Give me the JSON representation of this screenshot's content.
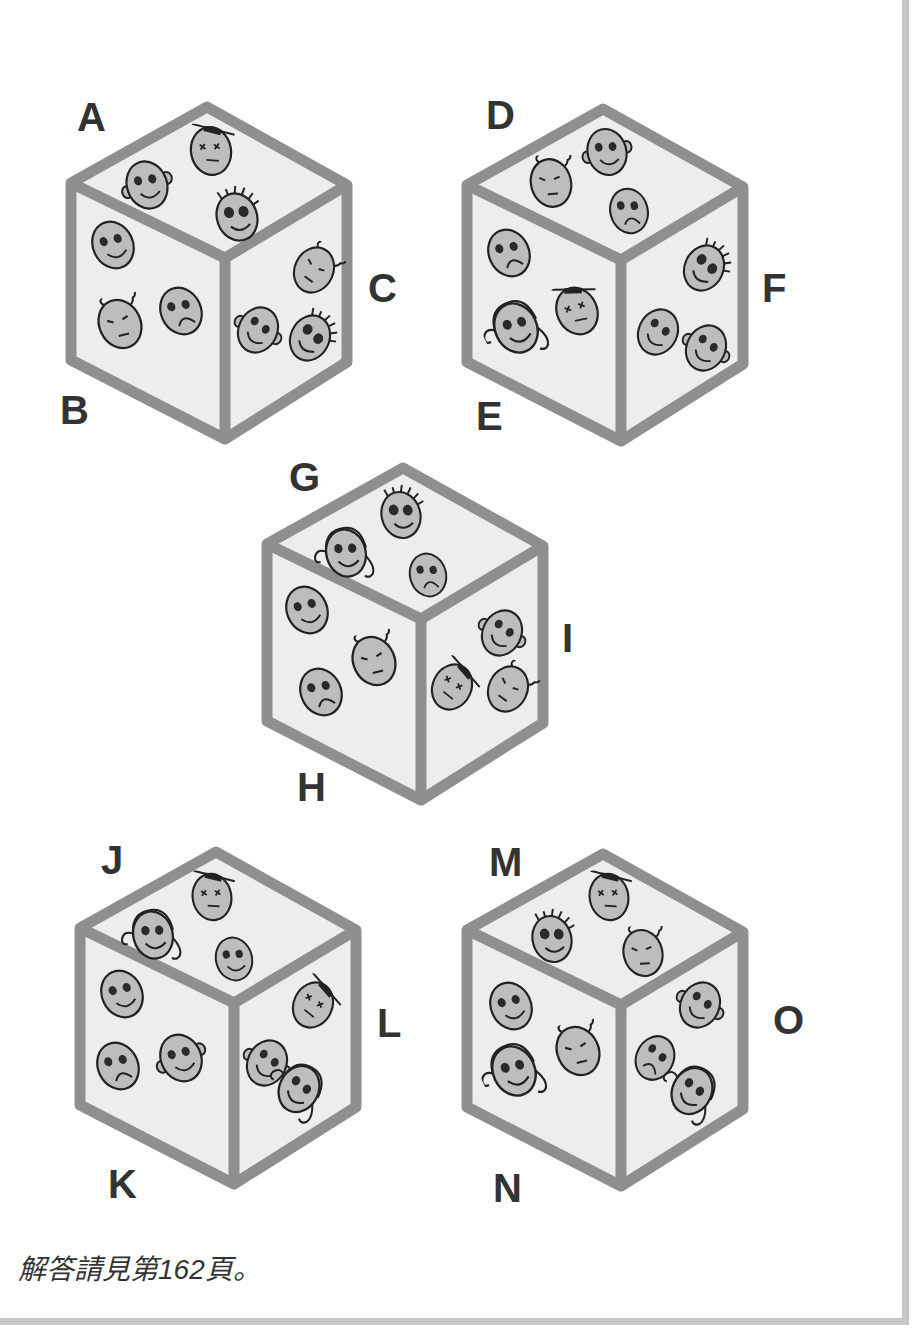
{
  "colors": {
    "frame": "#c6c6c6",
    "cube_edge": "#8f8f8f",
    "face_fill": "#ededed",
    "head_fill": "#bdbdbd",
    "ink": "#222222",
    "label": "#333333"
  },
  "cubes": [
    {
      "id": "cube-1",
      "labels": [
        "A",
        "B",
        "C"
      ],
      "faces": {
        "top": [
          "smile-ears",
          "dead-hat",
          "spiky-hair"
        ],
        "left": [
          "smile-plain",
          "sleepy-antenna",
          "frown"
        ],
        "right": [
          "sleepy-antenna",
          "smile-ears",
          "spiky-hair"
        ]
      }
    },
    {
      "id": "cube-2",
      "labels": [
        "D",
        "E",
        "F"
      ],
      "faces": {
        "top": [
          "sleepy-antenna",
          "smile-ears",
          "frown"
        ],
        "left": [
          "frown",
          "curly-hair",
          "dead-hat"
        ],
        "right": [
          "spiky-hair",
          "smile-plain",
          "smile-ears"
        ]
      }
    },
    {
      "id": "cube-3",
      "labels": [
        "G",
        "H",
        "I"
      ],
      "faces": {
        "top": [
          "curly-hair",
          "spiky-hair",
          "frown"
        ],
        "left": [
          "smile-plain",
          "sleepy-antenna",
          "frown"
        ],
        "right": [
          "smile-ears",
          "dead-hat",
          "sleepy-antenna"
        ]
      }
    },
    {
      "id": "cube-4",
      "labels": [
        "J",
        "K",
        "L"
      ],
      "faces": {
        "top": [
          "curly-hair",
          "dead-hat",
          "smile-plain"
        ],
        "left": [
          "smile-plain",
          "frown",
          "smile-ears"
        ],
        "right": [
          "dead-hat",
          "smile-ears",
          "curly-hair"
        ]
      }
    },
    {
      "id": "cube-5",
      "labels": [
        "M",
        "N",
        "O"
      ],
      "faces": {
        "top": [
          "spiky-hair",
          "dead-hat",
          "sleepy-antenna"
        ],
        "left": [
          "smile-plain",
          "curly-hair",
          "sleepy-antenna"
        ],
        "right": [
          "smile-ears",
          "frown",
          "curly-hair"
        ]
      }
    }
  ],
  "footer": {
    "answer_note": "解答請見第162頁。"
  }
}
